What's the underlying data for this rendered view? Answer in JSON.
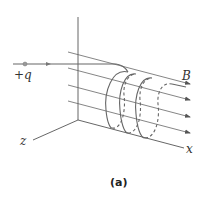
{
  "figure": {
    "caption": "(a)",
    "labels": {
      "charge": "+q",
      "field": "B",
      "x_axis": "x",
      "z_axis": "z"
    },
    "colors": {
      "line": "#555555",
      "axis": "#444444",
      "text": "#333333",
      "charge_dot": "#999999"
    }
  }
}
